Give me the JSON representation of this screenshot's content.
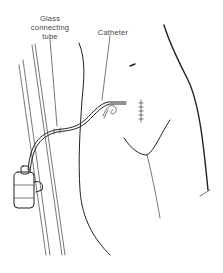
{
  "figure": {
    "type": "medical line illustration",
    "labels": {
      "glass_line1": "Glass",
      "glass_line2": "connecting",
      "glass_line3": "tube",
      "catheter": "Catheter"
    },
    "colors": {
      "ink": "#222222",
      "background": "#ffffff",
      "label_text": "#444444"
    }
  }
}
